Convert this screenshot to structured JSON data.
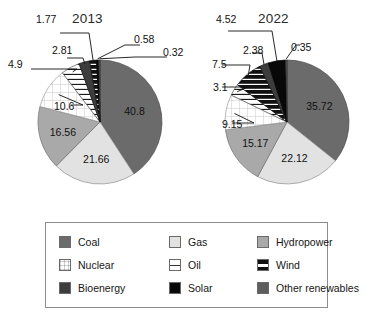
{
  "figure": {
    "background": "#ffffff",
    "charts": [
      {
        "id": "chart-2013",
        "title": "2013",
        "center": {
          "x": 100,
          "y": 122
        },
        "radius": 62
      },
      {
        "id": "chart-2022",
        "title": "2022",
        "center": {
          "x": 287,
          "y": 122
        },
        "radius": 62
      }
    ]
  },
  "legend": {
    "title": "",
    "position": "bottom",
    "items": [
      {
        "label": "Coal",
        "key": "coal",
        "color": "#6b6b6b",
        "pattern": "solid"
      },
      {
        "label": "Gas",
        "key": "gas",
        "color": "#e2e2e2",
        "pattern": "solid"
      },
      {
        "label": "Hydropower",
        "key": "hydropower",
        "color": "#a9a9a9",
        "pattern": "solid"
      },
      {
        "label": "Nuclear",
        "key": "nuclear",
        "color": "#ffffff",
        "pattern": "grid"
      },
      {
        "label": "Oil",
        "key": "oil",
        "color": "#ffffff",
        "pattern": "hline"
      },
      {
        "label": "Wind",
        "key": "wind",
        "color": "#111111",
        "pattern": "wind-stripe"
      },
      {
        "label": "Bioenergy",
        "key": "bioenergy",
        "color": "#3d3d3d",
        "pattern": "solid"
      },
      {
        "label": "Solar",
        "key": "solar",
        "color": "#080808",
        "pattern": "solid"
      },
      {
        "label": "Other renewables",
        "key": "other_renewables",
        "color": "#5e5e5e",
        "pattern": "solid"
      }
    ]
  },
  "chart_data": [
    {
      "type": "pie",
      "title": "2013",
      "unit": "percent",
      "categories": [
        "Coal",
        "Gas",
        "Hydropower",
        "Nuclear",
        "Oil",
        "Bioenergy",
        "Wind",
        "Solar",
        "Other renewables"
      ],
      "values": [
        40.8,
        21.66,
        16.56,
        10.6,
        4.9,
        2.81,
        1.77,
        0.58,
        0.32
      ],
      "labels": [
        "40.8",
        "21.66",
        "16.56",
        "10.6",
        "4.9",
        "2.81",
        "1.77",
        "0.58",
        "0.32"
      ],
      "label_placement": [
        "inside",
        "inside",
        "inside",
        "inside",
        "outside",
        "outside",
        "outside",
        "outside",
        "outside"
      ],
      "start_angle_deg": 0,
      "direction": "clockwise",
      "legend_position": "bottom"
    },
    {
      "type": "pie",
      "title": "2022",
      "unit": "percent",
      "categories": [
        "Coal",
        "Gas",
        "Hydropower",
        "Nuclear",
        "Oil",
        "Bioenergy",
        "Wind",
        "Solar",
        "Other renewables"
      ],
      "values": [
        35.72,
        22.12,
        15.17,
        9.15,
        3.1,
        2.38,
        7.5,
        4.52,
        0.35
      ],
      "labels": [
        "35.72",
        "22.12",
        "15.17",
        "9.15",
        "3.1",
        "2.38",
        "7.5",
        "4.52",
        "0.35"
      ],
      "label_placement": [
        "inside",
        "inside",
        "inside",
        "outside",
        "outside",
        "outside",
        "outside",
        "outside",
        "outside"
      ],
      "start_angle_deg": 0,
      "direction": "clockwise",
      "legend_position": "bottom"
    }
  ],
  "annotations_2013": [
    {
      "text": "1.77",
      "x": 36,
      "y": 14
    },
    {
      "text": "2.81",
      "x": 52,
      "y": 45
    },
    {
      "text": "4.9",
      "x": 8,
      "y": 59
    },
    {
      "text": "10.6",
      "x": 54,
      "y": 101
    },
    {
      "text": "0.58",
      "x": 134,
      "y": 34
    },
    {
      "text": "0.32",
      "x": 163,
      "y": 47
    }
  ],
  "annotations_2022": [
    {
      "text": "4.52",
      "x": 216,
      "y": 14
    },
    {
      "text": "2.38",
      "x": 243,
      "y": 45
    },
    {
      "text": "7.5",
      "x": 212,
      "y": 59
    },
    {
      "text": "3.1",
      "x": 213,
      "y": 82
    },
    {
      "text": "9.15",
      "x": 222,
      "y": 119
    },
    {
      "text": "0.35",
      "x": 291,
      "y": 42
    }
  ]
}
